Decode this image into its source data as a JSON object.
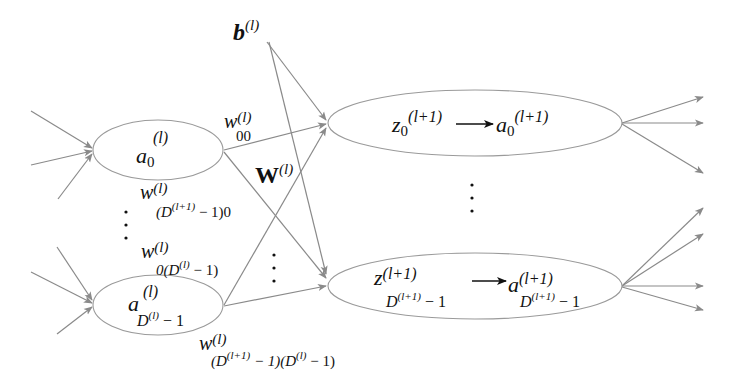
{
  "diagram": {
    "colors": {
      "edge": "#8a8a8a",
      "node_stroke": "#9a9a9a",
      "text": "#111111",
      "background": "#ffffff"
    },
    "bias": {
      "symbol": "b",
      "superscript": "(l)"
    },
    "weight_matrix": {
      "symbol": "W",
      "superscript": "(l)"
    },
    "input_nodes": [
      {
        "id": "a0",
        "symbol": "a",
        "subscript": "0",
        "superscript": "(l)"
      },
      {
        "id": "aD",
        "symbol": "a",
        "subscript": "D",
        "subscript_sup": "(l)",
        "subscript_tail": " − 1",
        "superscript": "(l)"
      }
    ],
    "output_nodes": [
      {
        "id": "z0",
        "z_symbol": "z",
        "z_sub": "0",
        "z_sup": "(l+1)",
        "a_symbol": "a",
        "a_sub": "0",
        "a_sup": "(l+1)"
      },
      {
        "id": "zD",
        "z_symbol": "z",
        "z_sup": "(l+1)",
        "sub_base": "D",
        "sub_sup": "(l+1)",
        "sub_tail": " − 1",
        "a_symbol": "a",
        "a_sup": "(l+1)"
      }
    ],
    "weights": [
      {
        "symbol": "w",
        "superscript": "(l)",
        "subscript": "00"
      },
      {
        "symbol": "w",
        "superscript": "(l)",
        "sub_open": "(D",
        "sub_sup": "(l+1)",
        "sub_tail": " − 1)0"
      },
      {
        "symbol": "w",
        "superscript": "(l)",
        "sub_open": "0(D",
        "sub_sup": "(l)",
        "sub_tail": " − 1)"
      },
      {
        "symbol": "w",
        "superscript": "(l)",
        "sub_open": "(D",
        "sub_sup": "(l+1)",
        "sub_mid": " − 1)(D",
        "sub_sup2": "(l)",
        "sub_tail": " − 1)"
      }
    ],
    "ellipsis": "⋮",
    "arrow_glyph": "→"
  }
}
